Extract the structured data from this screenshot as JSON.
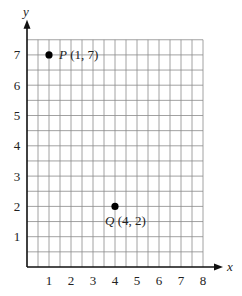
{
  "chart_data": {
    "type": "scatter",
    "title": "",
    "xlabel": "x",
    "ylabel": "y",
    "xlim": [
      0,
      8
    ],
    "ylim": [
      0,
      7.5
    ],
    "grid": true,
    "grid_minor_step": 0.5,
    "x_ticks": [
      "1",
      "2",
      "3",
      "4",
      "5",
      "6",
      "7",
      "8"
    ],
    "y_ticks": [
      "1",
      "2",
      "3",
      "4",
      "5",
      "6",
      "7"
    ],
    "points": [
      {
        "name": "P",
        "x": 1,
        "y": 7,
        "label": "P (1, 7)"
      },
      {
        "name": "Q",
        "x": 4,
        "y": 2,
        "label": "Q (4, 2)"
      }
    ]
  },
  "colors": {
    "axis": "#111111",
    "grid": "#8a8a8a",
    "point": "#000000",
    "text": "#222222"
  }
}
